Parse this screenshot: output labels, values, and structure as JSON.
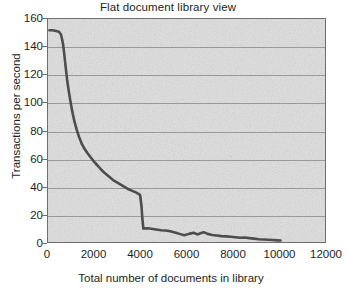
{
  "chart_data": {
    "type": "line",
    "title": "Flat document library view",
    "xlabel": "Total number of documents in library",
    "ylabel": "Transactions per second",
    "xlim": [
      0,
      12000
    ],
    "ylim": [
      0,
      160
    ],
    "xticks": [
      0,
      2000,
      4000,
      6000,
      8000,
      10000,
      12000
    ],
    "yticks": [
      0,
      20,
      40,
      60,
      80,
      100,
      120,
      140,
      160
    ],
    "xtick_labels": [
      "0",
      "2000",
      "4000",
      "6000",
      "8000",
      "10000",
      "12000"
    ],
    "ytick_labels": [
      "0",
      "20",
      "40",
      "60",
      "80",
      "100",
      "120",
      "140",
      "160"
    ],
    "grid": "horizontal",
    "legend": null,
    "series": [
      {
        "name": "Transactions per second",
        "color": "#4d4d4d",
        "line_width": 2.6,
        "x": [
          60,
          200,
          350,
          470,
          560,
          640,
          700,
          760,
          820,
          900,
          980,
          1060,
          1140,
          1240,
          1340,
          1460,
          1580,
          1700,
          1840,
          1980,
          2120,
          2280,
          2440,
          2620,
          2800,
          3000,
          3200,
          3400,
          3600,
          3800,
          3960,
          4020,
          4060,
          4100,
          4260,
          4450,
          4650,
          4860,
          5060,
          5260,
          5460,
          5660,
          5860,
          6060,
          6260,
          6420,
          6560,
          6700,
          6860,
          7060,
          7260,
          7460,
          7660,
          7860,
          8060,
          8260,
          8460,
          8660,
          8860,
          9060,
          9260,
          9460,
          9660,
          9860,
          10000
        ],
        "y": [
          152,
          152,
          151.5,
          151,
          149,
          143,
          135,
          126,
          117,
          108,
          100,
          93,
          87,
          81,
          76,
          71,
          67.5,
          64.5,
          61.5,
          58.5,
          56,
          53,
          50.5,
          48,
          45.5,
          43.5,
          41.5,
          39.5,
          38,
          36.5,
          35,
          27,
          18,
          11,
          11.2,
          10.8,
          10.3,
          9.8,
          9.6,
          9,
          8.2,
          7.2,
          6.2,
          7.2,
          8,
          6.8,
          7.6,
          8.4,
          7.2,
          6.4,
          6,
          5.6,
          5.4,
          5.2,
          4.8,
          4.4,
          4.6,
          4.2,
          3.8,
          3.4,
          3.2,
          3,
          2.8,
          2.6,
          2.5
        ]
      }
    ]
  },
  "style": {
    "plot_background": "#dfdfdf",
    "gridline_color": "#9a9a9a",
    "axis_color": "#6d6e71",
    "text_color": "#231f20",
    "line_color": "#4d4d4d"
  }
}
